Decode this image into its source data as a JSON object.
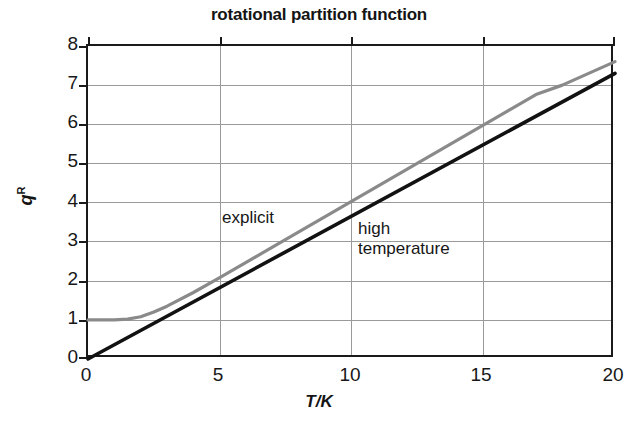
{
  "chart_data": {
    "type": "line",
    "title": "rotational partition function",
    "xlabel": "T/K",
    "ylabel": "q",
    "ylabel_superscript": "R",
    "xlim": [
      0,
      20
    ],
    "ylim": [
      0,
      8
    ],
    "xticks": [
      0,
      5,
      10,
      15,
      20
    ],
    "yticks": [
      0,
      1,
      2,
      3,
      4,
      5,
      6,
      7,
      8
    ],
    "grid": true,
    "legend": "inline-annotations",
    "series": [
      {
        "name": "explicit",
        "color": "#8a8a8a",
        "annotation": "explicit",
        "x": [
          0,
          0.5,
          1,
          1.5,
          2,
          2.5,
          3,
          4,
          5,
          6,
          7,
          8,
          9,
          10,
          11,
          12,
          13,
          14,
          15,
          16,
          17,
          18,
          19,
          20
        ],
        "y": [
          1.0,
          1.0,
          1.0,
          1.02,
          1.08,
          1.2,
          1.35,
          1.7,
          2.08,
          2.47,
          2.86,
          3.25,
          3.64,
          4.03,
          4.42,
          4.81,
          5.2,
          5.59,
          5.98,
          6.37,
          6.76,
          7.0,
          7.3,
          7.6
        ]
      },
      {
        "name": "high temperature",
        "color": "#121212",
        "annotation": "high\ntemperature",
        "x": [
          0,
          20
        ],
        "y": [
          0,
          7.3
        ]
      }
    ]
  },
  "chart": {
    "title": "rotational partition function",
    "axis_x_title": "T/K",
    "axis_y_title_base": "q",
    "axis_y_title_sup": "R",
    "ticks_x": [
      "0",
      "5",
      "10",
      "15",
      "20"
    ],
    "ticks_y": [
      "8",
      "7",
      "6",
      "5",
      "4",
      "3",
      "2",
      "1",
      "0"
    ],
    "annotations": {
      "explicit": "explicit",
      "high_temperature": "high\ntemperature"
    },
    "colors": {
      "explicit_curve": "#8a8a8a",
      "high_temperature_line": "#121212",
      "axis": "#1a1a1a",
      "grid": "#9a9a9a",
      "background": "#ffffff",
      "text": "#141414"
    }
  }
}
